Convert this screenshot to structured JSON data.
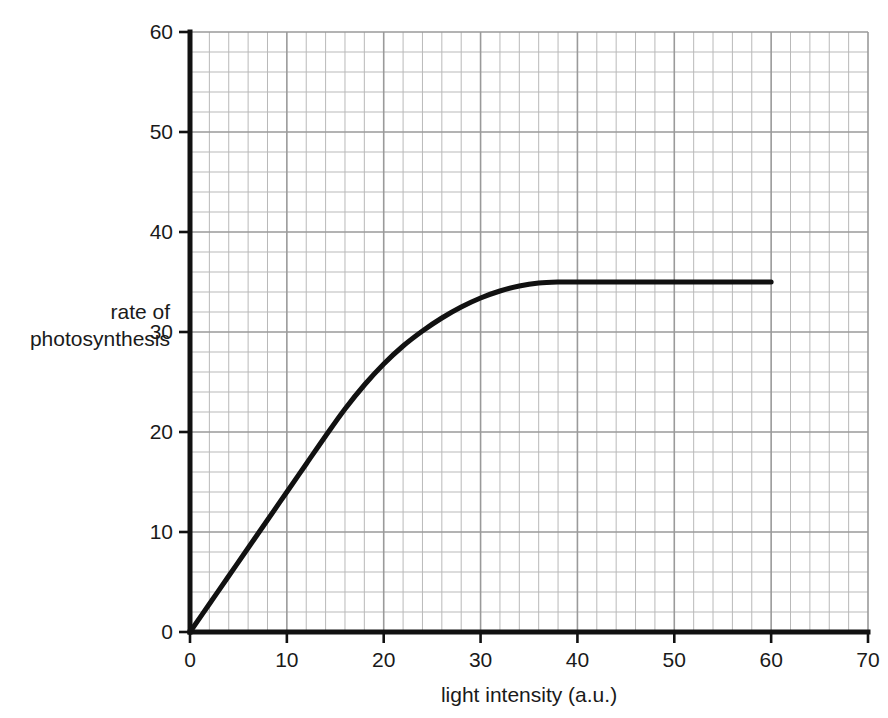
{
  "chart_data": {
    "type": "line",
    "title": "",
    "subtitle": "",
    "xlabel": "light intensity (a.u.)",
    "ylabel": "rate of photosynthesis",
    "ylabel_lines": [
      "rate of",
      "photosynthesis"
    ],
    "xlim": [
      0,
      70
    ],
    "ylim": [
      0,
      60
    ],
    "xticks": [
      0,
      10,
      20,
      30,
      40,
      50,
      60,
      70
    ],
    "yticks": [
      0,
      10,
      20,
      30,
      40,
      50,
      60
    ],
    "xtick_labels": [
      "0",
      "10",
      "20",
      "30",
      "40",
      "50",
      "60",
      "70"
    ],
    "ytick_labels": [
      "0",
      "10",
      "20",
      "30",
      "40",
      "50",
      "60"
    ],
    "minor_tick_step_x": 2,
    "minor_tick_step_y": 2,
    "grid": true,
    "grid_color": "#9a9a9a",
    "grid_minor_color": "#b9b9b9",
    "legend": false,
    "legend_position": "none",
    "line_color": "#111111",
    "line_width": 5,
    "series": [
      {
        "name": "rate of photosynthesis",
        "x": [
          0,
          2,
          4,
          6,
          8,
          10,
          12,
          14,
          16,
          18,
          20,
          22,
          24,
          26,
          28,
          30,
          32,
          34,
          36,
          38,
          40,
          45,
          50,
          55,
          60
        ],
        "y": [
          0,
          2.8,
          5.6,
          8.4,
          11.2,
          14.0,
          16.8,
          19.6,
          22.3,
          24.7,
          26.8,
          28.6,
          30.1,
          31.4,
          32.5,
          33.4,
          34.1,
          34.6,
          34.9,
          35.0,
          35.0,
          35.0,
          35.0,
          35.0,
          35.0
        ]
      }
    ],
    "annotations": {
      "plateau_value": 35,
      "saturation_x": 38,
      "linear_region": "0 to about 17",
      "curve_end_x": 60
    }
  },
  "axes": {
    "x_axis_name": "light-intensity-axis",
    "y_axis_name": "rate-of-photosynthesis-axis"
  }
}
